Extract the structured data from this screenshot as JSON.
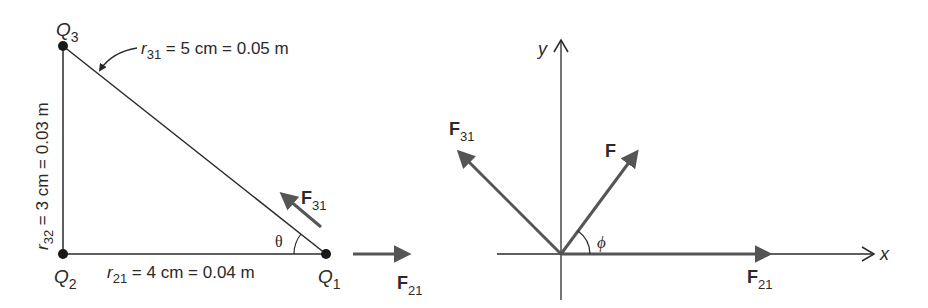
{
  "left_figure": {
    "charges": {
      "q3": {
        "base": "Q",
        "sub": "3"
      },
      "q2": {
        "base": "Q",
        "sub": "2"
      },
      "q1": {
        "base": "Q",
        "sub": "1"
      }
    },
    "r31": {
      "base": "r",
      "sub": "31",
      "text": " = 5 cm = 0.05 m"
    },
    "r32": {
      "base": "r",
      "sub": "32",
      "text": " = 3 cm = 0.03 m"
    },
    "r21": {
      "base": "r",
      "sub": "21",
      "text": " = 4 cm = 0.04 m"
    },
    "angle": "θ",
    "force_f31": {
      "base": "F",
      "sub": "31"
    },
    "force_f21": {
      "base": "F",
      "sub": "21"
    }
  },
  "right_figure": {
    "axis_x": "x",
    "axis_y": "y",
    "angle": "ϕ",
    "force_f31": {
      "base": "F",
      "sub": "31"
    },
    "force_f": {
      "base": "F"
    },
    "force_f21": {
      "base": "F",
      "sub": "21"
    }
  },
  "colors": {
    "line": "#2a2a2a",
    "force_arrow": "#555555",
    "background": "#ffffff"
  }
}
